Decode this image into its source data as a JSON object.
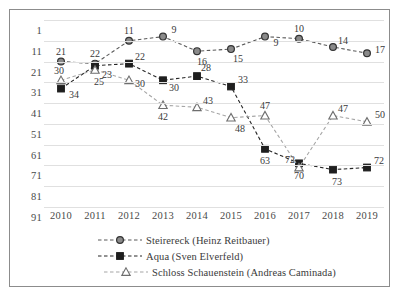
{
  "chart_data": {
    "type": "line",
    "title": "",
    "xlabel": "",
    "ylabel": "",
    "categories": [
      "2010",
      "2011",
      "2012",
      "2013",
      "2014",
      "2015",
      "2016",
      "2017",
      "2018",
      "2019"
    ],
    "ylim": [
      1,
      91
    ],
    "y_inverted": true,
    "yticks": [
      "1",
      "11",
      "21",
      "31",
      "41",
      "51",
      "61",
      "71",
      "81",
      "91"
    ],
    "grid": true,
    "legend_position": "bottom",
    "series": [
      {
        "name": "Steirereck (Heinz Reitbauer)",
        "marker": "circle",
        "color": "#595959",
        "linestyle": "dashed",
        "values": [
          21,
          22,
          11,
          9,
          16,
          15,
          9,
          10,
          14,
          17
        ]
      },
      {
        "name": "Aqua (Sven Elverfeld)",
        "marker": "square",
        "color": "#262626",
        "linestyle": "dashed",
        "values": [
          34,
          23,
          22,
          30,
          28,
          33,
          63,
          70,
          73,
          72
        ]
      },
      {
        "name": "Schloss Schauenstein (Andreas Caminada)",
        "marker": "triangle",
        "color": "#a6a6a6",
        "linestyle": "dashed",
        "values": [
          30,
          25,
          30,
          42,
          43,
          48,
          47,
          72,
          47,
          50
        ]
      }
    ]
  },
  "legend": {
    "items": [
      "Steirereck (Heinz Reitbauer)",
      "Aqua (Sven Elverfeld)",
      "Schloss Schauenstein (Andreas Caminada)"
    ]
  }
}
